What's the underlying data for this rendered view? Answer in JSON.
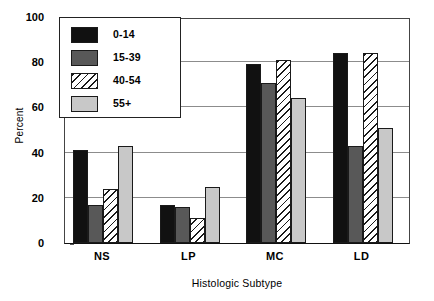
{
  "chart_data": {
    "type": "bar",
    "title": "",
    "xlabel": "Histologic Subtype",
    "ylabel": "Percent",
    "categories": [
      "NS",
      "LP",
      "MC",
      "LD"
    ],
    "ylim": [
      0,
      100
    ],
    "yticks": [
      0,
      20,
      40,
      60,
      80,
      100
    ],
    "grid": true,
    "legend_position": "top-left",
    "series": [
      {
        "name": "0-14",
        "color": "#111111",
        "pattern": "solid",
        "values": [
          41,
          17,
          79,
          84
        ]
      },
      {
        "name": "15-39",
        "color": "#585858",
        "pattern": "solid",
        "values": [
          17,
          16,
          71,
          43
        ]
      },
      {
        "name": "40-54",
        "color": "#ffffff",
        "pattern": "diagonal-hatch",
        "values": [
          24,
          11,
          81,
          84
        ]
      },
      {
        "name": "55+",
        "color": "#c8c8c8",
        "pattern": "solid",
        "values": [
          43,
          25,
          64,
          51
        ]
      }
    ]
  },
  "axes": {
    "y_title": "Percent",
    "x_title": "Histologic Subtype",
    "y_tick_labels": [
      "0",
      "20",
      "40",
      "60",
      "80",
      "100"
    ],
    "x_tick_labels": [
      "NS",
      "LP",
      "MC",
      "LD"
    ]
  },
  "legend": {
    "items": [
      {
        "label": "0-14"
      },
      {
        "label": "15-39"
      },
      {
        "label": "40-54"
      },
      {
        "label": "55+"
      }
    ]
  }
}
